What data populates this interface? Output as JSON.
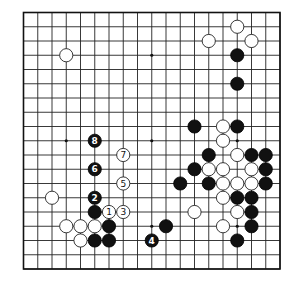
{
  "board": {
    "size": 19,
    "origin_x": 23.5,
    "origin_y": 12.5,
    "spacing": 14.25,
    "stone_radius": 6.6,
    "colors": {
      "line": "#222222",
      "black": "#111111",
      "white": "#ffffff",
      "background": "#ffffff"
    },
    "star_points": [
      [
        3,
        3
      ],
      [
        9,
        3
      ],
      [
        15,
        3
      ],
      [
        3,
        9
      ],
      [
        9,
        9
      ],
      [
        15,
        9
      ],
      [
        3,
        15
      ],
      [
        9,
        15
      ],
      [
        15,
        15
      ]
    ],
    "white_stones": [
      [
        15,
        1
      ],
      [
        13,
        2
      ],
      [
        16,
        2
      ],
      [
        3,
        3
      ],
      [
        14,
        8
      ],
      [
        14,
        9
      ],
      [
        15,
        10
      ],
      [
        13,
        11
      ],
      [
        14,
        11
      ],
      [
        16,
        11
      ],
      [
        14,
        12
      ],
      [
        15,
        12
      ],
      [
        16,
        12
      ],
      [
        14,
        13
      ],
      [
        15,
        14
      ],
      [
        12,
        14
      ],
      [
        14,
        15
      ],
      [
        2,
        13
      ],
      [
        3,
        15
      ],
      [
        4,
        15
      ],
      [
        5,
        15
      ],
      [
        4,
        16
      ]
    ],
    "black_stones": [
      [
        15,
        3
      ],
      [
        15,
        5
      ],
      [
        12,
        8
      ],
      [
        15,
        8
      ],
      [
        13,
        10
      ],
      [
        16,
        10
      ],
      [
        17,
        10
      ],
      [
        12,
        11
      ],
      [
        17,
        11
      ],
      [
        11,
        12
      ],
      [
        13,
        12
      ],
      [
        17,
        12
      ],
      [
        15,
        13
      ],
      [
        16,
        13
      ],
      [
        16,
        14
      ],
      [
        16,
        15
      ],
      [
        15,
        16
      ],
      [
        10,
        15
      ],
      [
        5,
        14
      ],
      [
        6,
        15
      ],
      [
        5,
        16
      ],
      [
        6,
        16
      ]
    ],
    "numbered_moves": [
      {
        "number": "1",
        "color": "white",
        "col": 6,
        "row": 14
      },
      {
        "number": "2",
        "color": "black",
        "col": 5,
        "row": 13
      },
      {
        "number": "3",
        "color": "white",
        "col": 7,
        "row": 14
      },
      {
        "number": "4",
        "color": "black",
        "col": 9,
        "row": 16
      },
      {
        "number": "5",
        "color": "white",
        "col": 7,
        "row": 12
      },
      {
        "number": "6",
        "color": "black",
        "col": 5,
        "row": 11
      },
      {
        "number": "7",
        "color": "white",
        "col": 7,
        "row": 10
      },
      {
        "number": "8",
        "color": "black",
        "col": 5,
        "row": 9
      }
    ]
  }
}
